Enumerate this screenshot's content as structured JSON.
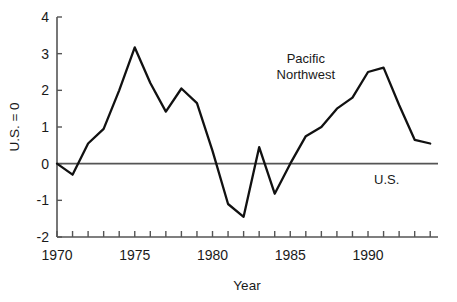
{
  "chart_data": {
    "type": "line",
    "title": "",
    "xlabel": "Year",
    "ylabel": "U.S. = 0",
    "xlim": [
      1970,
      1994.5
    ],
    "ylim": [
      -2,
      4
    ],
    "grid": false,
    "legend": "inline-annotations",
    "x_tick_labels": [
      "1970",
      "1975",
      "1980",
      "1985",
      "1990"
    ],
    "x_tick_values": [
      1970,
      1975,
      1980,
      1985,
      1990
    ],
    "x_minor_tick_step": 1,
    "y_tick_labels": [
      "4",
      "3",
      "2",
      "1",
      "0",
      "-1",
      "-2"
    ],
    "y_tick_values": [
      4,
      3,
      2,
      1,
      0,
      -1,
      -2
    ],
    "x": [
      1970,
      1971,
      1972,
      1973,
      1974,
      1975,
      1976,
      1977,
      1978,
      1979,
      1980,
      1981,
      1982,
      1983,
      1984,
      1985,
      1986,
      1987,
      1988,
      1989,
      1990,
      1991,
      1992,
      1993,
      1994
    ],
    "series": [
      {
        "name": "Pacific Northwest",
        "color": "#111111",
        "values": [
          0.0,
          -0.3,
          0.55,
          0.95,
          2.0,
          3.17,
          2.2,
          1.42,
          2.05,
          1.65,
          0.35,
          -1.1,
          -1.45,
          0.45,
          -0.82,
          0.0,
          0.75,
          1.0,
          1.5,
          1.8,
          2.5,
          2.62,
          1.6,
          0.65,
          0.55
        ]
      },
      {
        "name": "U.S.",
        "color": "#555555",
        "values": [
          0,
          0,
          0,
          0,
          0,
          0,
          0,
          0,
          0,
          0,
          0,
          0,
          0,
          0,
          0,
          0,
          0,
          0,
          0,
          0,
          0,
          0,
          0,
          0,
          0
        ]
      }
    ],
    "annotations": [
      {
        "id": "pacific-northwest-label",
        "line1": "Pacific",
        "line2": "Northwest",
        "x": 1986.0,
        "y": 2.75
      },
      {
        "id": "us-label",
        "text": "U.S.",
        "x": 1991.2,
        "y": -0.55
      }
    ]
  }
}
